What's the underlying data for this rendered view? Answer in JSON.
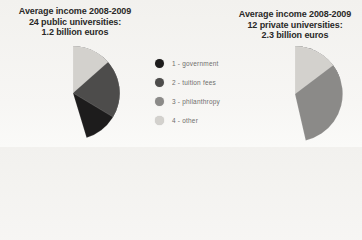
{
  "page": {
    "background": "#f4f3f0",
    "description_text_color": "#2a2928"
  },
  "chart_data": [
    {
      "type": "pie",
      "title_lines": [
        "Average income 2008-2009",
        "24 public universities:",
        "1.2 billion euros"
      ],
      "title": "Average income 2008-2009 24 public universities: 1.2 billion euros",
      "total_label": "1.2 billion euros",
      "start_angle_deg": 0,
      "direction": "clockwise",
      "units": "percent of total income (estimated from slice angles)",
      "slices": [
        {
          "label": "1 - government",
          "value": 45.3,
          "color": "#1d1c1c"
        },
        {
          "label": "2 - tuition fees",
          "value": 33.6,
          "color": "#4d4c4b"
        },
        {
          "label": "3 - philanthropy",
          "value": 7.6,
          "color": "#8b8a88"
        },
        {
          "label": "4 - other",
          "value": 13.5,
          "color": "#d3d1cd"
        }
      ]
    },
    {
      "type": "pie",
      "title_lines": [
        "Average income 2008-2009",
        "12 private universities:",
        "2.3 billion euros"
      ],
      "title": "Average income 2008-2009 12 private universities: 2.3 billion euros",
      "total_label": "2.3 billion euros",
      "start_angle_deg": 0,
      "direction": "clockwise",
      "units": "percent of total income (estimated from slice angles)",
      "slices": [
        {
          "label": "1 - government",
          "value": 20.0,
          "color": "#1d1c1c"
        },
        {
          "label": "2 - tuition fees",
          "value": 18.9,
          "color": "#4d4c4b"
        },
        {
          "label": "3 - philanthropy",
          "value": 46.4,
          "color": "#8b8a88"
        },
        {
          "label": "4 - other",
          "value": 14.7,
          "color": "#d3d1cd"
        }
      ]
    }
  ],
  "legend": {
    "position": "center-between-pies",
    "items": [
      {
        "label": "1 - government",
        "color": "#1d1c1c"
      },
      {
        "label": "2 - tuition fees",
        "color": "#4d4c4b"
      },
      {
        "label": "3 - philanthropy",
        "color": "#8b8a88"
      },
      {
        "label": "4 - other",
        "color": "#d3d1cd"
      }
    ]
  }
}
